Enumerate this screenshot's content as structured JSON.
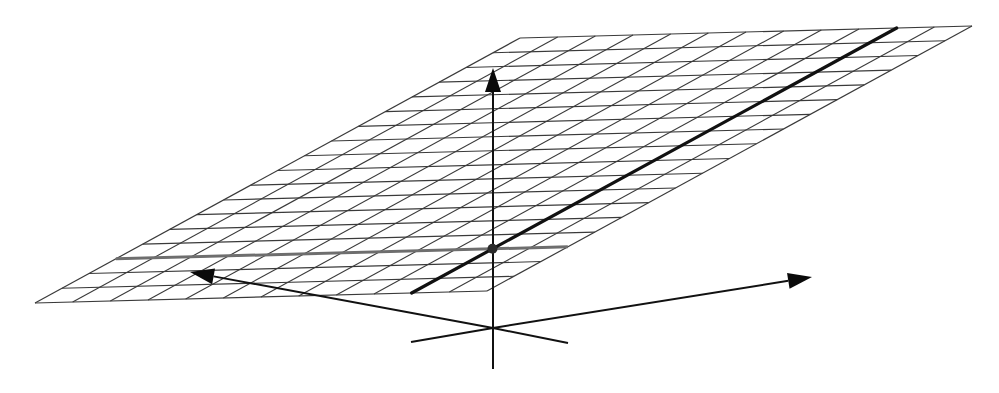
{
  "figure": {
    "type": "3d-plane-with-axes",
    "width": 999,
    "height": 393,
    "background": "#ffffff"
  },
  "plane": {
    "corners": {
      "bottom_left": [
        35,
        303
      ],
      "bottom_right": [
        487,
        291
      ],
      "top_left": [
        520,
        38
      ],
      "top_right": [
        970,
        25
      ]
    },
    "columns": 12,
    "rows": 18,
    "grid_color": "#3a3a3a"
  },
  "highlighted_column": {
    "index": 10,
    "color": "#111111",
    "description": "bold line across plane"
  },
  "highlighted_row": {
    "index": 3,
    "color": "#6e6e6e",
    "description": "gray line across plane"
  },
  "intersection_point": {
    "column": 10,
    "row": 3,
    "radius": 5,
    "color": "#2a2a2a"
  },
  "axes": {
    "origin": [
      493,
      328
    ],
    "arrows": [
      {
        "name": "vertical-axis",
        "to": [
          493,
          68
        ]
      },
      {
        "name": "left-axis",
        "to": [
          190,
          272
        ]
      },
      {
        "name": "right-axis",
        "to": [
          812,
          277
        ]
      }
    ],
    "stubs": [
      {
        "name": "vertical-axis-negative",
        "to": [
          493,
          369
        ]
      },
      {
        "name": "left-axis-negative",
        "to": [
          568,
          343
        ]
      },
      {
        "name": "right-axis-negative",
        "to": [
          411,
          342
        ]
      }
    ],
    "color": "#111111"
  }
}
